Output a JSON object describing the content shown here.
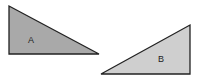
{
  "shapes": [
    {
      "id": "A",
      "label": "A",
      "fill": "#a9a9a9",
      "stroke": "#222222"
    },
    {
      "id": "B",
      "label": "B",
      "fill": "#cfcfcf",
      "stroke": "#222222"
    }
  ]
}
